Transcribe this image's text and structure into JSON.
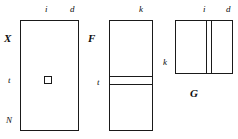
{
  "figure": {
    "stroke_color": "#1a1a1a",
    "background_color": "#ffffff"
  },
  "matrices": {
    "x": {
      "name": "X",
      "label_top_left": "i",
      "label_top_right": "d",
      "label_left_middle": "t",
      "label_left_bottom": "N",
      "highlight": "element"
    },
    "f": {
      "name": "F",
      "label_top_right": "k",
      "label_left_middle": "t",
      "highlight": "row-band"
    },
    "g": {
      "name": "G",
      "label_top_left": "i",
      "label_top_right": "d",
      "label_left_middle": "k",
      "highlight": "column-band"
    }
  }
}
